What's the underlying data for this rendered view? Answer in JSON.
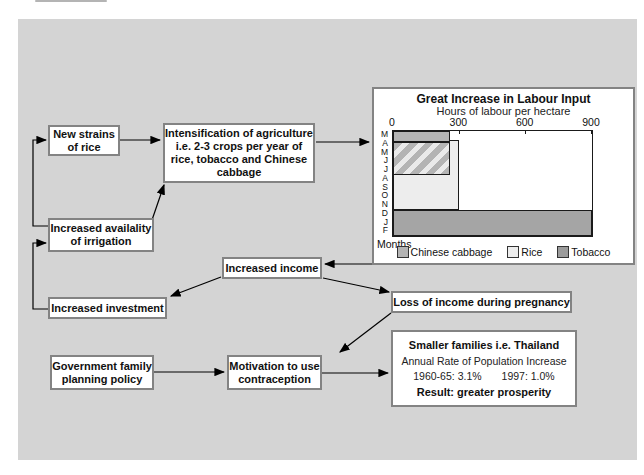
{
  "nodes": {
    "new_strains": {
      "label": "New strains\nof rice"
    },
    "intensification": {
      "label": "Intensification of agriculture\ni.e. 2-3 crops per year of\nrice, tobacco and Chinese\ncabbage"
    },
    "irrigation": {
      "label": "Increased availality\nof irrigation"
    },
    "increased_income": {
      "label": "Increased income"
    },
    "increased_investment": {
      "label": "Increased investment"
    },
    "loss_income": {
      "label": "Loss of income during pregnancy"
    },
    "government_policy": {
      "label": "Government family\nplanning policy"
    },
    "motivation": {
      "label": "Motivation to use\ncontraception"
    },
    "smaller_families": {
      "title": "Smaller families i.e. Thailand",
      "subtitle": "Annual Rate of Population Increase",
      "rate_1960_65": "1960-65: 3.1%",
      "rate_1997": "1997: 1.0%",
      "result": "Result: greater prosperity"
    }
  },
  "chart_data": {
    "type": "bar",
    "orientation": "horizontal",
    "title": "Great Increase in Labour Input",
    "subtitle": "Hours of labour per hectare",
    "ylabel": "Months",
    "x_max": 900,
    "x_ticks": [
      0,
      300,
      600,
      900
    ],
    "month_categories": [
      "M",
      "A",
      "M",
      "J",
      "J",
      "A",
      "S",
      "O",
      "N",
      "D",
      "J",
      "F"
    ],
    "bars": [
      {
        "crop": "Rice",
        "hours": 300,
        "row_start": 1,
        "row_end": 9,
        "style": "solid",
        "color": "#ededed"
      },
      {
        "crop": "Chinese cabbage",
        "hours": 260,
        "row_start": 0,
        "row_end": 1.25,
        "style": "solid",
        "color": "#b4b4b4"
      },
      {
        "crop": "Chinese cabbage and Rice overlap",
        "hours": 260,
        "row_start": 1.25,
        "row_end": 5,
        "style": "hatched",
        "color": "hatch"
      },
      {
        "crop": "Tobacco",
        "hours": 900,
        "row_start": 9,
        "row_end": 12,
        "style": "solid",
        "color": "#a5a5a5"
      }
    ],
    "legend": [
      {
        "label": "Chinese cabbage",
        "color": "#b4b4b4"
      },
      {
        "label": "Rice",
        "color": "#ededed"
      },
      {
        "label": "Tobacco",
        "color": "#9b9b9b"
      }
    ]
  }
}
